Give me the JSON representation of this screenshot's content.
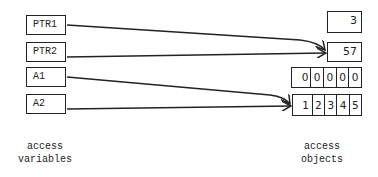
{
  "variables": [
    {
      "label": "PTR1"
    },
    {
      "label": "PTR2"
    },
    {
      "label": "A1"
    },
    {
      "label": "A2"
    }
  ],
  "objects": {
    "scalar_3": "3",
    "scalar_57": "57",
    "array_zeros": [
      "0",
      "0",
      "0",
      "0",
      "0"
    ],
    "array_values": [
      "1",
      "2",
      "3",
      "4",
      "5"
    ]
  },
  "references": [
    {
      "from": "PTR1",
      "to": "57"
    },
    {
      "from": "PTR2",
      "to": "57"
    },
    {
      "from": "A1",
      "to": "array 1 2 3 4 5"
    },
    {
      "from": "A2",
      "to": "array 1 2 3 4 5"
    }
  ],
  "captions": {
    "left_line1": "access",
    "left_line2": "variables",
    "right_line1": "access",
    "right_line2": "objects"
  }
}
